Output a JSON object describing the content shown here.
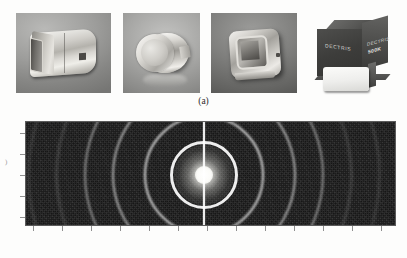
{
  "figure": {
    "panels": [
      {
        "id": "a",
        "label": "(a)",
        "description": "Photographs of hybrid photon counting X-ray detector modules"
      },
      {
        "id": "b",
        "label": "(b)",
        "description": "Powder diffraction pattern recorded on the detector"
      }
    ]
  },
  "panel_a": {
    "label": "(a)",
    "photos": [
      {
        "name": "detector-angled-view",
        "alt_text": "Angled view of a metallic detector head with rectangular entrance window"
      },
      {
        "name": "detector-cylindrical-front",
        "alt_text": "Cylindrical detector seen from the front showing circular entrance face"
      },
      {
        "name": "detector-square-aperture",
        "alt_text": "Detector housing with square aperture viewed at an angle"
      },
      {
        "name": "dectris-boxed-detector",
        "brand": "DECTRIS",
        "model": "500K",
        "alt_text": "Dark boxed DECTRIS detector with white front panel"
      }
    ]
  },
  "panel_b": {
    "label": "(b)",
    "image_name": "powder-diffraction-pattern",
    "alt_text": "Wide-format powder diffraction image with concentric Debye-Scherrer rings, saturated direct beam at the centre and a vertical inter-module gap"
  },
  "chart_data": {
    "type": "heatmap",
    "title": "",
    "xlabel": "",
    "ylabel": "",
    "legend_position": "none",
    "grid": false,
    "detector": {
      "width_px": 371,
      "height_px": 105,
      "background_level": 0.1,
      "beam_center_x": 178,
      "beam_center_y": 53
    },
    "direct_beam": {
      "halo_radius": 30,
      "core_radius": 9,
      "intensity": 1.0
    },
    "module_gap": {
      "orientation": "vertical",
      "x": 178,
      "width": 3,
      "intensity": 0.95
    },
    "rings": [
      {
        "radius": 34,
        "intensity": 0.92,
        "thickness": 3.0
      },
      {
        "radius": 60,
        "intensity": 0.8,
        "thickness": 2.6
      },
      {
        "radius": 92,
        "intensity": 0.62,
        "thickness": 2.2
      },
      {
        "radius": 120,
        "intensity": 0.48,
        "thickness": 2.0
      },
      {
        "radius": 148,
        "intensity": 0.38,
        "thickness": 1.8
      },
      {
        "radius": 176,
        "intensity": 0.3,
        "thickness": 1.6
      },
      {
        "radius": 206,
        "intensity": 0.24,
        "thickness": 1.5
      },
      {
        "radius": 238,
        "intensity": 0.19,
        "thickness": 1.4
      }
    ],
    "xticks": [
      8,
      37,
      66,
      95,
      124,
      153,
      182,
      211,
      240,
      269,
      298,
      327,
      356
    ],
    "yticks": [
      12,
      33,
      54,
      75,
      96
    ],
    "xticklabels": [],
    "yticklabels": []
  }
}
